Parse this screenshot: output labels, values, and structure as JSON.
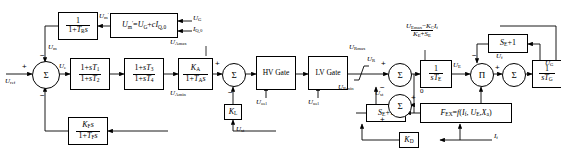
{
  "diagram": {
    "type": "control-block-diagram",
    "width": 561,
    "height": 154,
    "line_color": "#000000",
    "background": "#ffffff"
  },
  "blocks": [
    {
      "id": "transducer",
      "name": "transducer-block",
      "kind": "transfer-function",
      "numerator": "1",
      "denominator": "1 + T_R s",
      "num_html": "1",
      "den_html": "1+<i class='v'>T</i><sub>R</sub><i class='v'>s</i>"
    },
    {
      "id": "comp",
      "name": "compensation-block",
      "kind": "equation",
      "text": "U'_m = U_G + cI_Q,0",
      "text_html": "<i class='v'>U</i><sub>m</sub><sup>&prime;</sup>=<i class='v'>U</i><sub>G</sub>+<i class='v'>c</i><i class='v'>I</i><sub>Q,0</sub>"
    },
    {
      "id": "lead_lag_1",
      "name": "lead-lag-block-1",
      "kind": "transfer-function",
      "numerator": "1 + sT_1",
      "denominator": "1 + sT_2",
      "num_html": "1+<i class='v'>sT</i><sub>1</sub>",
      "den_html": "1+<i class='v'>sT</i><sub>2</sub>"
    },
    {
      "id": "lead_lag_2",
      "name": "lead-lag-block-2",
      "kind": "transfer-function",
      "numerator": "1 + sT_3",
      "denominator": "1 + sT_4",
      "num_html": "1+<i class='v'>sT</i><sub>3</sub>",
      "den_html": "1+<i class='v'>sT</i><sub>4</sub>"
    },
    {
      "id": "amplifier",
      "name": "amplifier-block",
      "kind": "transfer-function",
      "numerator": "K_A",
      "denominator": "1 + T_A s",
      "num_html": "<i class='v'>K</i><sub>A</sub>",
      "den_html": "1+<i class='v'>T</i><sub>A</sub><i class='v'>s</i>"
    },
    {
      "id": "hv_gate",
      "name": "hv-gate-block",
      "kind": "gate",
      "label": "HV Gate"
    },
    {
      "id": "lv_gate",
      "name": "lv-gate-block",
      "kind": "gate",
      "label": "LV Gate"
    },
    {
      "id": "exciter_integrator",
      "name": "exciter-integrator-block",
      "kind": "transfer-function",
      "numerator": "1",
      "denominator": "sT_E",
      "num_html": "1",
      "den_html": "<i class='v'>sT</i><sub>E</sub>"
    },
    {
      "id": "generator_integrator",
      "name": "generator-integrator-block",
      "kind": "transfer-function",
      "numerator": "1",
      "denominator": "sT_G",
      "num_html": "1",
      "den_html": "<i class='v'>sT</i><sub>G</sub>"
    },
    {
      "id": "saturation_top",
      "name": "saturation-block-top",
      "kind": "gain",
      "text": "S_E + 1",
      "text_html": "<i class='v'>S</i><sub>E</sub>+1"
    },
    {
      "id": "saturation_bottom",
      "name": "saturation-block-bottom",
      "kind": "gain",
      "text": "S_E + 1",
      "text_html": "<i class='v'>S</i><sub>E</sub>+1"
    },
    {
      "id": "fex",
      "name": "fex-function-block",
      "kind": "function",
      "text": "F_EX = f(I_f, U_E, X_a)",
      "text_html": "<i class='v'>F</i><sub>EX</sub>=<i class='v'>f</i>(<i class='v'>I</i><sub>f</sub>, <i class='v'>U</i><sub>E</sub>,<i class='v'>X</i><sub>a</sub>)"
    },
    {
      "id": "stabilizer",
      "name": "stabilizer-feedback-block",
      "kind": "transfer-function",
      "numerator": "K_F s",
      "denominator": "1 + T_F s",
      "num_html": "<i class='v'>K</i><sub>F</sub><i class='v'>s</i>",
      "den_html": "1+<i class='v'>T</i><sub>F</sub><i class='v'>s</i>"
    },
    {
      "id": "kl_gain",
      "name": "kl-gain-block",
      "kind": "gain",
      "text": "K_L",
      "text_html": "<i class='v'>K</i><sub>L</sub>"
    },
    {
      "id": "kd_gain",
      "name": "kd-gain-block",
      "kind": "gain",
      "text": "K_D",
      "text_html": "<i class='v'>K</i><sub>D</sub>"
    }
  ],
  "summers": [
    {
      "id": "sum_main",
      "name": "summing-junction-main",
      "symbol": "Σ"
    },
    {
      "id": "sum_amp",
      "name": "summing-junction-amplifier",
      "symbol": "Σ"
    },
    {
      "id": "sum_exciter",
      "name": "summing-junction-exciter",
      "symbol": "Σ"
    },
    {
      "id": "sum_sat",
      "name": "summing-junction-saturation",
      "symbol": "Σ"
    },
    {
      "id": "sum_gen",
      "name": "summing-junction-generator",
      "symbol": "Σ"
    },
    {
      "id": "mult_pi",
      "name": "multiplier-junction",
      "symbol": "Π"
    }
  ],
  "signals": {
    "u_ref": {
      "name": "signal-u-ref",
      "html": "<i class='v'>U</i><sub>ref</sub>"
    },
    "u_m": {
      "name": "signal-u-m",
      "html": "<i class='v'>U</i><sub>m</sub>"
    },
    "u_m_prime": {
      "name": "signal-u-m-prime",
      "html": "<i class='v'>U</i><sub>m</sub><sup>&prime;</sup>"
    },
    "u_e": {
      "name": "signal-u-e",
      "html": "<i class='v'>U</i><sub>e</sub>"
    },
    "u_g": {
      "name": "signal-u-g",
      "html": "<i class='v'>U</i><sub>G</sub>"
    },
    "i_q0": {
      "name": "signal-i-q0",
      "html": "<i class='v'>I</i><sub>Q,0</sub>"
    },
    "u_amax": {
      "name": "limit-u-a-max",
      "html": "<i class='v'>U</i><sub>Amax</sub>"
    },
    "u_amin": {
      "name": "limit-u-a-min",
      "html": "<i class='v'>U</i><sub>Amin</sub>"
    },
    "u_oel": {
      "name": "signal-u-oel",
      "html": "<i class='v'>U</i><sub>oel</sub>"
    },
    "u_uel": {
      "name": "signal-u-uel",
      "html": "<i class='v'>U</i><sub>uel</sub>"
    },
    "u_rmax": {
      "name": "limit-u-r-max",
      "html": "<i class='v'>U</i><sub>Rmax</sub>"
    },
    "u_rmin": {
      "name": "limit-u-r-min",
      "html": "<i class='v'>U</i><sub>Rmin</sub>"
    },
    "u_r": {
      "name": "signal-u-r",
      "html": "<i class='v'>U</i><sub>R</sub>"
    },
    "u_e_exc": {
      "name": "signal-u-e-exciter",
      "html": "<i class='v'>U</i><sub>E</sub>"
    },
    "u_f": {
      "name": "signal-u-f",
      "html": "<i class='v'>U</i><sub>f</sub>"
    },
    "i_f": {
      "name": "signal-i-f",
      "html": "<i class='v'>I</i><sub>f</sub>"
    },
    "u_st": {
      "name": "signal-u-st",
      "html": "<i class='v'>U</i><sub>st</sub>"
    },
    "zero": {
      "name": "limit-zero",
      "html": "0"
    }
  },
  "annotations": {
    "exciter_limit": {
      "name": "exciter-upper-limit-expression",
      "num_html": "<i class='v'>U</i><sub>Emax</sub>&minus;<i class='v'>K</i><sub>C</sub><i class='v'>I</i><sub>f</sub>",
      "den_html": "<i class='v'>K</i><sub>E</sub>+<i class='v'>S</i><sub>E</sub>",
      "text": "(U_Emax - K_C I_f) / (K_E + S_E)"
    }
  },
  "polarities": {
    "plus": "+",
    "minus": "−"
  }
}
